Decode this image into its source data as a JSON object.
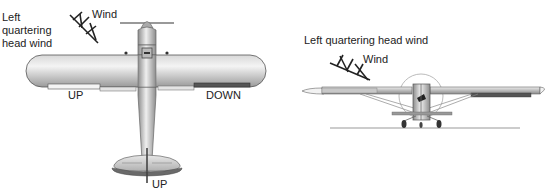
{
  "left_view": {
    "title": "Left quartering head wind",
    "title_lines": [
      "Left",
      "quartering",
      "head wind"
    ],
    "wind_label": "Wind",
    "left_aileron_label": "UP",
    "right_aileron_label": "DOWN",
    "elevator_label": "UP",
    "view": "top view of high-wing airplane"
  },
  "right_view": {
    "title": "Left quartering head wind",
    "wind_label": "Wind",
    "view": "front view of high-wing airplane on ground"
  }
}
